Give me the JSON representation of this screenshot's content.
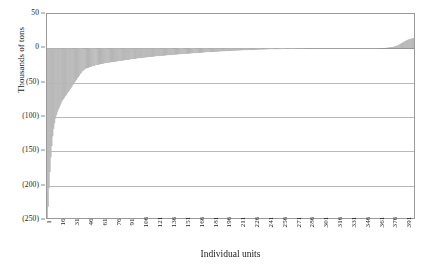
{
  "chart_data": {
    "type": "bar",
    "title": "",
    "subtitle": "",
    "xlabel": "Individual units",
    "ylabel": "Thousands of tons",
    "grid": true,
    "legend": null,
    "legend_position": "none",
    "bar_color": "#c2c2c2",
    "bar_edge_color": "#a8a8a8",
    "axis_color": "#9a9a9a",
    "grid_color": "#b9b9b9",
    "ylim": [
      -250,
      50
    ],
    "yticks": [
      50,
      0,
      -50,
      -100,
      -150,
      -200,
      -250
    ],
    "ytick_labels": [
      "50",
      "0",
      "(50)",
      "(100)",
      "(150)",
      "(200)",
      "(250)"
    ],
    "xlim": [
      1,
      400
    ],
    "xticks": [
      1,
      16,
      31,
      46,
      61,
      76,
      91,
      106,
      121,
      136,
      151,
      166,
      181,
      196,
      211,
      226,
      241,
      256,
      271,
      286,
      301,
      316,
      331,
      346,
      361,
      376,
      391
    ],
    "xtick_labels": [
      "1",
      "16",
      "31",
      "46",
      "61",
      "76",
      "91",
      "106",
      "121",
      "136",
      "151",
      "166",
      "181",
      "196",
      "211",
      "226",
      "241",
      "256",
      "271",
      "286",
      "301",
      "316",
      "331",
      "346",
      "361",
      "376",
      "391"
    ],
    "n_bars": 400,
    "values": [
      -250,
      -232,
      -205,
      -181,
      -160,
      -143,
      -129,
      -118,
      -110,
      -103,
      -98,
      -94,
      -90,
      -87,
      -84,
      -81,
      -78,
      -76,
      -74,
      -72,
      -70,
      -68,
      -66,
      -64,
      -62,
      -60,
      -58,
      -56,
      -54,
      -52,
      -50,
      -48,
      -46,
      -44,
      -42,
      -40,
      -38,
      -36,
      -34,
      -33,
      -32,
      -31,
      -30,
      -29.5,
      -29,
      -28.5,
      -28,
      -27.5,
      -27,
      -26.6,
      -26.2,
      -25.8,
      -25.4,
      -25,
      -24.7,
      -24.4,
      -24.1,
      -23.8,
      -23.5,
      -23.2,
      -22.9,
      -22.6,
      -22.3,
      -22,
      -21.8,
      -21.6,
      -21.4,
      -21.2,
      -21,
      -20.8,
      -20.6,
      -20.4,
      -20.2,
      -20,
      -19.8,
      -19.6,
      -19.4,
      -19.2,
      -19,
      -18.8,
      -18.6,
      -18.4,
      -18.2,
      -18,
      -17.8,
      -17.6,
      -17.4,
      -17.2,
      -17,
      -16.8,
      -16.6,
      -16.4,
      -16.2,
      -16,
      -15.8,
      -15.6,
      -15.4,
      -15.2,
      -15,
      -14.85,
      -14.7,
      -14.55,
      -14.4,
      -14.25,
      -14.1,
      -13.95,
      -13.8,
      -13.65,
      -13.5,
      -13.35,
      -13.2,
      -13.05,
      -12.9,
      -12.75,
      -12.6,
      -12.45,
      -12.3,
      -12.15,
      -12,
      -11.88,
      -11.76,
      -11.64,
      -11.52,
      -11.4,
      -11.28,
      -11.16,
      -11.04,
      -10.92,
      -10.8,
      -10.68,
      -10.56,
      -10.44,
      -10.32,
      -10.2,
      -10.08,
      -9.96,
      -9.84,
      -9.72,
      -9.6,
      -9.5,
      -9.4,
      -9.3,
      -9.2,
      -9.1,
      -9,
      -8.9,
      -8.8,
      -8.7,
      -8.6,
      -8.5,
      -8.4,
      -8.3,
      -8.2,
      -8.1,
      -8,
      -7.9,
      -7.8,
      -7.7,
      -7.6,
      -7.5,
      -7.4,
      -7.3,
      -7.2,
      -7.1,
      -7,
      -6.9,
      -6.8,
      -6.7,
      -6.6,
      -6.5,
      -6.4,
      -6.3,
      -6.2,
      -6.1,
      -6,
      -5.92,
      -5.84,
      -5.76,
      -5.68,
      -5.6,
      -5.52,
      -5.44,
      -5.36,
      -5.28,
      -5.2,
      -5.12,
      -5.04,
      -4.96,
      -4.88,
      -4.8,
      -4.72,
      -4.64,
      -4.56,
      -4.48,
      -4.4,
      -4.32,
      -4.24,
      -4.16,
      -4.08,
      -4,
      -3.94,
      -3.88,
      -3.82,
      -3.76,
      -3.7,
      -3.64,
      -3.58,
      -3.52,
      -3.46,
      -3.4,
      -3.34,
      -3.28,
      -3.22,
      -3.16,
      -3.1,
      -3.04,
      -2.98,
      -2.92,
      -2.86,
      -2.8,
      -2.75,
      -2.7,
      -2.65,
      -2.6,
      -2.55,
      -2.5,
      -2.45,
      -2.4,
      -2.35,
      -2.3,
      -2.25,
      -2.2,
      -2.15,
      -2.1,
      -2.05,
      -2,
      -1.96,
      -1.92,
      -1.88,
      -1.84,
      -1.8,
      -1.76,
      -1.72,
      -1.68,
      -1.64,
      -1.6,
      -1.56,
      -1.52,
      -1.48,
      -1.44,
      -1.4,
      -1.37,
      -1.34,
      -1.31,
      -1.28,
      -1.25,
      -1.22,
      -1.19,
      -1.16,
      -1.13,
      -1.1,
      -1.07,
      -1.04,
      -1.01,
      -0.98,
      -0.95,
      -0.92,
      -0.89,
      -0.86,
      -0.83,
      -0.8,
      -0.78,
      -0.76,
      -0.74,
      -0.72,
      -0.7,
      -0.68,
      -0.66,
      -0.64,
      -0.62,
      -0.6,
      -0.58,
      -0.56,
      -0.54,
      -0.52,
      -0.5,
      -0.48,
      -0.46,
      -0.44,
      -0.42,
      -0.4,
      -0.39,
      -0.38,
      -0.37,
      -0.36,
      -0.35,
      -0.34,
      -0.33,
      -0.32,
      -0.31,
      -0.3,
      -0.29,
      -0.28,
      -0.27,
      -0.26,
      -0.25,
      -0.24,
      -0.23,
      -0.22,
      -0.21,
      -0.2,
      -0.19,
      -0.18,
      -0.17,
      -0.16,
      -0.15,
      -0.14,
      -0.13,
      -0.12,
      -0.11,
      -0.1,
      -0.09,
      -0.08,
      -0.07,
      -0.06,
      -0.05,
      -0.04,
      -0.03,
      -0.02,
      -0.01,
      0,
      0,
      0,
      0,
      0,
      0,
      0,
      0,
      0,
      0,
      0,
      0,
      0,
      0,
      0,
      0,
      0,
      0,
      0,
      0,
      0,
      0,
      0,
      0,
      0,
      0,
      0,
      0,
      0.02,
      0.05,
      0.08,
      0.12,
      0.16,
      0.2,
      0.25,
      0.3,
      0.36,
      0.42,
      0.5,
      0.6,
      0.7,
      0.82,
      0.95,
      1.1,
      1.3,
      1.5,
      1.8,
      2.1,
      2.5,
      2.9,
      3.4,
      3.9,
      4.5,
      5.1,
      5.8,
      6.5,
      7.3,
      8.1,
      9.0,
      9.8,
      10.5,
      11.2,
      11.8,
      12.4,
      12.9,
      13.4,
      13.8,
      14.2,
      14.6,
      15.0
    ]
  }
}
